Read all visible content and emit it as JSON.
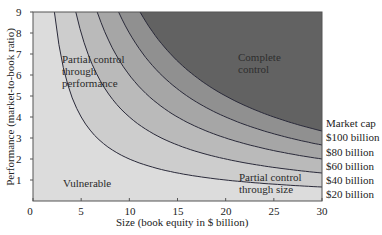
{
  "chart_data": {
    "type": "area",
    "title": "",
    "xlabel": "Size (book equity in $ billion)",
    "ylabel": "Performance (market-to-book ratio)",
    "xlim": [
      0,
      30
    ],
    "ylim": [
      0,
      9
    ],
    "x_ticks": [
      0,
      5,
      10,
      15,
      20,
      25,
      30
    ],
    "y_ticks": [
      1,
      2,
      3,
      4,
      5,
      6,
      7,
      8,
      9
    ],
    "grid": false,
    "curve_formula": "performance = market_cap / size",
    "legend": {
      "title": "Market cap",
      "position": "right",
      "entries": [
        "$100 billion",
        "$80 billion",
        "$60 billion",
        "$40 billion",
        "$20 billion"
      ]
    },
    "series": [
      {
        "name": "$20 billion",
        "market_cap": 20,
        "x": [
          2.22,
          3,
          5,
          10,
          15,
          20,
          25,
          30
        ],
        "y": [
          9,
          6.67,
          4,
          2,
          1.33,
          1,
          0.8,
          0.67
        ]
      },
      {
        "name": "$40 billion",
        "market_cap": 40,
        "x": [
          4.44,
          5,
          10,
          15,
          20,
          25,
          30
        ],
        "y": [
          9,
          8,
          4,
          2.67,
          2,
          1.6,
          1.33
        ]
      },
      {
        "name": "$60 billion",
        "market_cap": 60,
        "x": [
          6.67,
          10,
          15,
          20,
          25,
          30
        ],
        "y": [
          9,
          6,
          4,
          3,
          2.4,
          2
        ]
      },
      {
        "name": "$80 billion",
        "market_cap": 80,
        "x": [
          8.89,
          10,
          15,
          20,
          25,
          30
        ],
        "y": [
          9,
          8,
          5.33,
          4,
          3.2,
          2.67
        ]
      },
      {
        "name": "$100 billion",
        "market_cap": 100,
        "x": [
          11.11,
          15,
          20,
          25,
          30
        ],
        "y": [
          9,
          6.67,
          5,
          4,
          3.33
        ]
      }
    ],
    "regions": [
      {
        "label": "Vulnerable",
        "x": 3.1,
        "y": 1
      },
      {
        "label": "Partial control through performance",
        "x": 3,
        "y": 6.3
      },
      {
        "label": "Complete control",
        "x": 21.3,
        "y": 6.8
      },
      {
        "label": "Partial control through size",
        "x": 21.3,
        "y": 1.2
      }
    ],
    "band_colors": [
      "#dcdcdc",
      "#cdcdcd",
      "#bababa",
      "#a6a6a6",
      "#909090",
      "#626262"
    ]
  },
  "labels": {
    "title_clipped": "...ing the competitive space...",
    "vulnerable": "Vulnerable",
    "partial_perf_1": "Partial control",
    "partial_perf_2": "through",
    "partial_perf_3": "performance",
    "complete_1": "Complete",
    "complete_2": "control",
    "partial_size_1": "Partial control",
    "partial_size_2": "through size",
    "legend_title": "Market cap",
    "legend_100": "$100 billion",
    "legend_80": "$80 billion",
    "legend_60": "$60 billion",
    "legend_40": "$40 billion",
    "legend_20": "$20 billion",
    "xlabel": "Size (book equity in $ billion)",
    "ylabel": "Performance (market-to-book ratio)",
    "x0": "0",
    "x5": "5",
    "x10": "10",
    "x15": "15",
    "x20": "20",
    "x25": "25",
    "x30": "30",
    "y1": "1",
    "y2": "2",
    "y3": "3",
    "y4": "4",
    "y5": "5",
    "y6": "6",
    "y7": "7",
    "y8": "8",
    "y9": "9"
  }
}
